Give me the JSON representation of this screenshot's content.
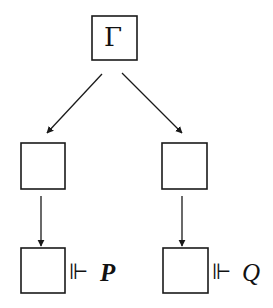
{
  "diagram": {
    "type": "tree",
    "nodes": {
      "root": {
        "label": "Γ"
      },
      "mid_left": {
        "label": ""
      },
      "mid_right": {
        "label": ""
      },
      "leaf_left": {
        "label": ""
      },
      "leaf_right": {
        "label": ""
      }
    },
    "edges": [
      {
        "from": "root",
        "to": "mid_left"
      },
      {
        "from": "root",
        "to": "mid_right"
      },
      {
        "from": "mid_left",
        "to": "leaf_left"
      },
      {
        "from": "mid_right",
        "to": "leaf_right"
      }
    ],
    "annotations": {
      "left": {
        "symbol": "⊩",
        "proposition": "P"
      },
      "right": {
        "symbol": "⊩",
        "proposition": "Q"
      }
    },
    "colors": {
      "stroke": "#1a1a1a",
      "background": "#ffffff"
    }
  }
}
